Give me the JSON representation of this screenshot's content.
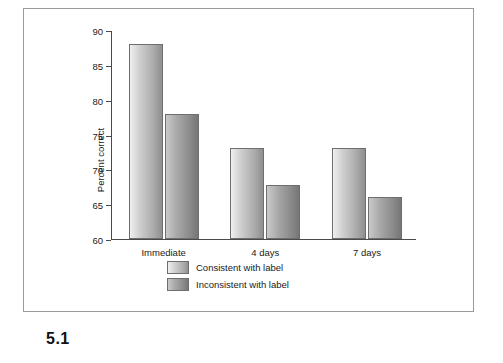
{
  "figure": {
    "caption": "5.1"
  },
  "chart_data": {
    "type": "bar",
    "title": "",
    "xlabel": "",
    "ylabel": "Percent correct",
    "categories": [
      "Immediate",
      "4 days",
      "7 days"
    ],
    "ylim": [
      60,
      90
    ],
    "yticks": [
      60,
      65,
      70,
      75,
      80,
      85,
      90
    ],
    "ytick_labels": [
      "60",
      "65",
      "70",
      "75",
      "80",
      "85",
      "90"
    ],
    "grid": false,
    "legend_position": "below-axes",
    "series": [
      {
        "name": "Consistent with label",
        "values": [
          88,
          73,
          73
        ]
      },
      {
        "name": "Inconsistent with label",
        "values": [
          78,
          67.8,
          66
        ]
      }
    ]
  }
}
